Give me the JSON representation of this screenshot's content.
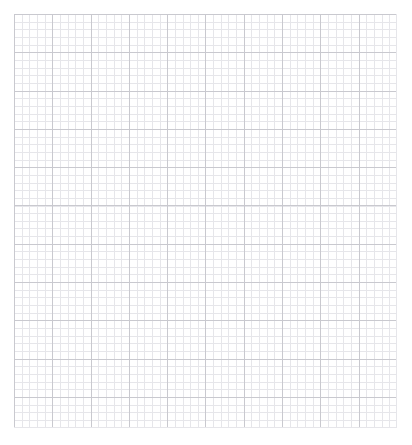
{
  "document": {
    "kind": "graph-paper",
    "title": "Blank graph paper sheet",
    "page_background": "#ffffff",
    "canvas": {
      "width": 412,
      "height": 445
    }
  },
  "grid": {
    "origin_x": 14,
    "origin_y": 14,
    "width": 383,
    "height": 414,
    "minor_spacing": 7.66,
    "major_every": 5,
    "major_spacing": 38.3,
    "columns": 50,
    "rows": 54,
    "minor_color": "#e6e6ea",
    "major_color": "#c9c9cf",
    "line_width": 1,
    "fill_color": "#ffffff"
  },
  "content": {
    "text_items": [],
    "annotations": [],
    "note": ""
  }
}
